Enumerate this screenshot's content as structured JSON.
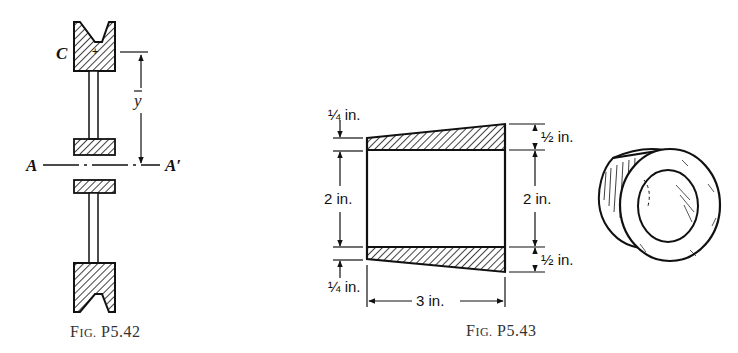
{
  "figures": [
    {
      "id": "P5.42",
      "caption": {
        "prefix": "F",
        "smallcaps": "IG.",
        "number": "P5.42"
      },
      "labels": {
        "centroid": "C",
        "axis_left": "A",
        "axis_right": "A′",
        "distance": "y"
      }
    },
    {
      "id": "P5.43",
      "caption": {
        "prefix": "F",
        "smallcaps": "IG.",
        "number": "P5.43"
      },
      "labels": {
        "left_top_thickness": "¼ in.",
        "left_bottom_thickness": "¼ in.",
        "left_inner": "2 in.",
        "right_top_thickness": "½ in.",
        "right_bottom_thickness": "½ in.",
        "right_inner": "2 in.",
        "length": "3 in.",
        "in_unit": "in."
      }
    }
  ],
  "colors": {
    "ink": "#111111",
    "background": "#ffffff"
  }
}
